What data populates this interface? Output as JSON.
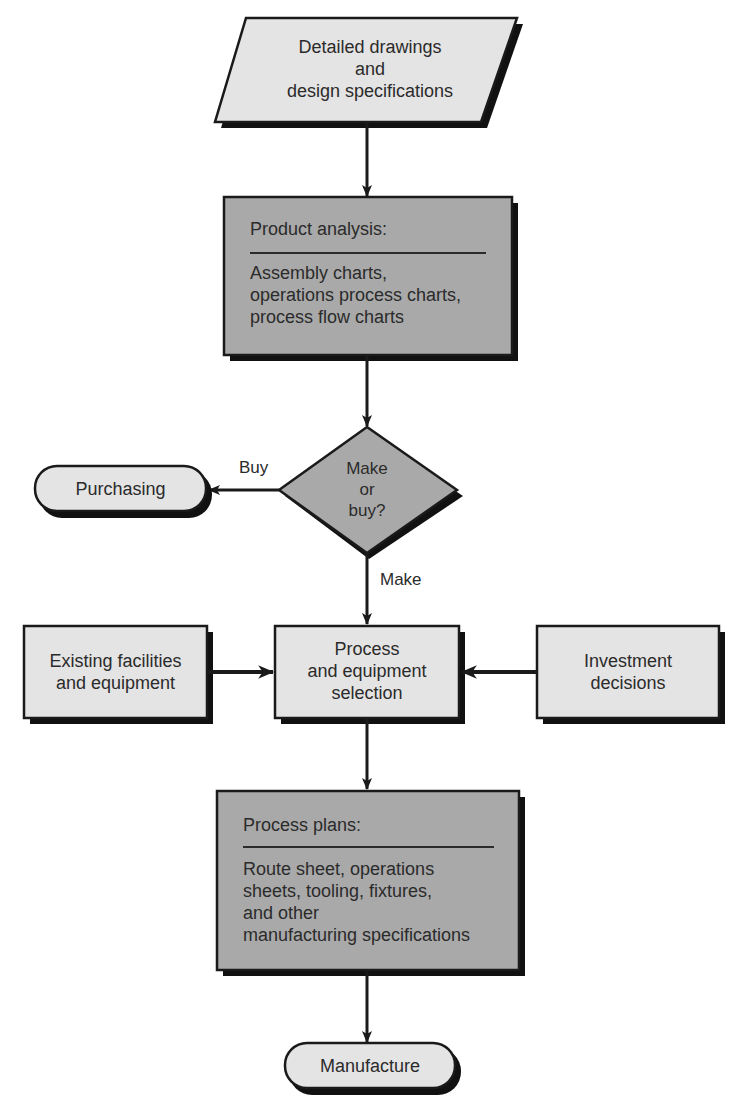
{
  "diagram": {
    "type": "flowchart",
    "colors": {
      "light_fill": "#e4e4e4",
      "dark_fill": "#a9a9a9",
      "stroke": "#1a1a1a",
      "shadow": "#111111"
    },
    "nodes": {
      "input": {
        "shape": "parallelogram",
        "lines": [
          "Detailed drawings",
          "and",
          "design specifications"
        ]
      },
      "product_analysis": {
        "shape": "rectangle",
        "header": "Product analysis:",
        "lines": [
          "Assembly charts,",
          "operations process charts,",
          "process flow charts"
        ]
      },
      "decision": {
        "shape": "diamond",
        "lines": [
          "Make",
          "or",
          "buy?"
        ]
      },
      "purchasing": {
        "shape": "terminal",
        "label": "Purchasing"
      },
      "existing_facilities": {
        "shape": "rectangle",
        "lines": [
          "Existing facilities",
          "and equipment"
        ]
      },
      "process_selection": {
        "shape": "rectangle",
        "lines": [
          "Process",
          "and equipment",
          "selection"
        ]
      },
      "investment": {
        "shape": "rectangle",
        "lines": [
          "Investment",
          "decisions"
        ]
      },
      "process_plans": {
        "shape": "rectangle",
        "header": "Process plans:",
        "lines": [
          "Route sheet, operations",
          "sheets, tooling, fixtures,",
          "and other",
          "manufacturing specifications"
        ]
      },
      "manufacture": {
        "shape": "terminal",
        "label": "Manufacture"
      }
    },
    "edges": [
      {
        "from": "input",
        "to": "product_analysis",
        "label": ""
      },
      {
        "from": "product_analysis",
        "to": "decision",
        "label": ""
      },
      {
        "from": "decision",
        "to": "purchasing",
        "label": "Buy"
      },
      {
        "from": "decision",
        "to": "process_selection",
        "label": "Make"
      },
      {
        "from": "existing_facilities",
        "to": "process_selection",
        "label": ""
      },
      {
        "from": "investment",
        "to": "process_selection",
        "label": ""
      },
      {
        "from": "process_selection",
        "to": "process_plans",
        "label": ""
      },
      {
        "from": "process_plans",
        "to": "manufacture",
        "label": ""
      }
    ],
    "edge_labels": {
      "buy": "Buy",
      "make": "Make"
    }
  }
}
